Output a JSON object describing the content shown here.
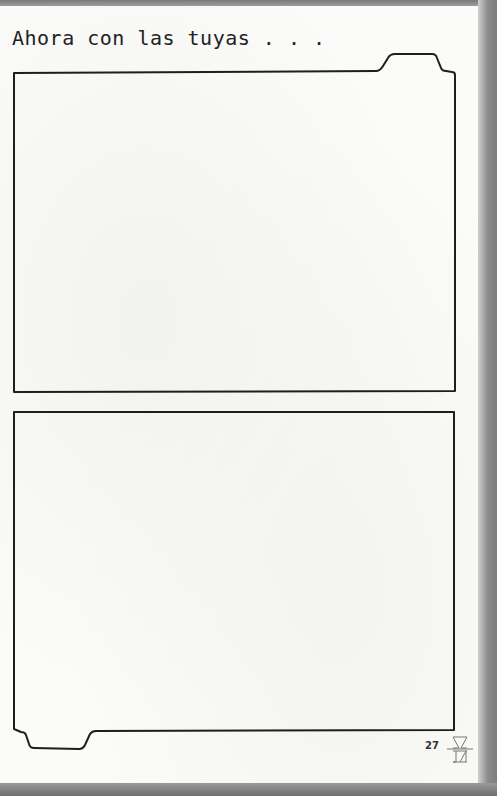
{
  "page": {
    "heading": "Ahora con las tuyas . . .",
    "page_number": "27",
    "frames": [
      {
        "name": "upper-drawing-frame",
        "tab": "top-right"
      },
      {
        "name": "lower-drawing-frame",
        "tab": "bottom-left"
      }
    ],
    "logo_icon": "publisher-monogram-icon",
    "colors": {
      "paper": "#fbfbfa",
      "ink": "#1e1e1e",
      "background": "#8a8a8a"
    }
  }
}
